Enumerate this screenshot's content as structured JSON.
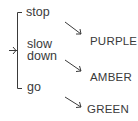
{
  "inputs": [
    {
      "id": "stop",
      "label": "stop"
    },
    {
      "id": "slow_down",
      "label_line1": "slow",
      "label_line2": "down"
    },
    {
      "id": "go",
      "label": "go"
    }
  ],
  "outputs": [
    {
      "label": "PURPLE"
    },
    {
      "label": "AMBER"
    },
    {
      "label": "GREEN"
    }
  ],
  "colors": {
    "stroke": "#3a3a3a",
    "text": "#3a3a3a",
    "background": "#ffffff"
  }
}
